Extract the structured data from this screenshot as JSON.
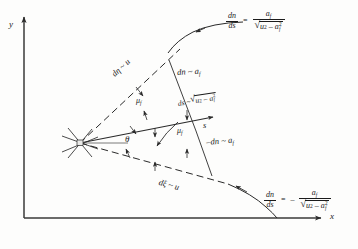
{
  "figure": {
    "type": "diagram",
    "axes": {
      "y_label": "y",
      "x_label": "x"
    },
    "vertex_label": "P",
    "angles": {
      "theta": "θ",
      "mu_upper": "μ",
      "mu_upper_sub": "f",
      "mu_lower": "μ",
      "mu_lower_sub": "f"
    },
    "ray_labels": {
      "streamline": "s",
      "upper_characteristic": "dη ~ u",
      "lower_characteristic": "dξ ~ u",
      "upper_normal": "dn ~ a",
      "upper_normal_sub": "f",
      "lower_normal": "–dn ~ a",
      "lower_normal_sub": "f",
      "arc": "ds ~ ",
      "arc_radicand_base": "u",
      "arc_radicand_exp": "2",
      "arc_radicand_minus": "–",
      "arc_radicand_a": "a",
      "arc_radicand_a_sub": "f",
      "arc_radicand_a_sup": "2"
    },
    "formulas": {
      "upper": {
        "lhs_num": "dn",
        "lhs_den": "ds",
        "equals": "=",
        "sign": "",
        "rhs_num_base": "a",
        "rhs_num_sub": "f",
        "rhs_rad_base": "u",
        "rhs_rad_exp": "2",
        "rhs_rad_minus": "–",
        "rhs_rad_a": "a",
        "rhs_rad_a_sub": "f",
        "rhs_rad_a_sup": "2"
      },
      "lower": {
        "lhs_num": "dn",
        "lhs_den": "ds",
        "equals": "=",
        "sign": "–",
        "rhs_num_base": "a",
        "rhs_num_sub": "f",
        "rhs_rad_base": "u",
        "rhs_rad_exp": "2",
        "rhs_rad_minus": "–",
        "rhs_rad_a": "a",
        "rhs_rad_a_sub": "f",
        "rhs_rad_a_sup": "2"
      }
    },
    "colors": {
      "ink": "#1b1b1b",
      "paper": "#fdfdfc"
    }
  }
}
